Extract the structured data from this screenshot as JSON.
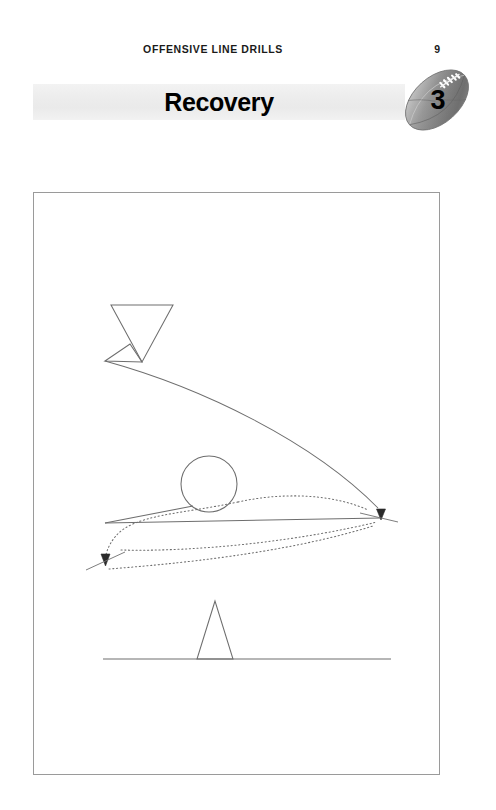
{
  "page": {
    "background_color": "#ffffff",
    "width": 496,
    "height": 810
  },
  "running_head": {
    "title": "OFFENSIVE LINE DRILLS",
    "folio": "9"
  },
  "title_band": {
    "chapter_title": "Recovery",
    "band_color": "#ededed"
  },
  "badge": {
    "icon": "football-icon",
    "chapter_number": "3",
    "ball_color": "#8c8c8c",
    "lace_color": "#ffffff"
  },
  "diagram": {
    "frame_color": "#9a9a9a",
    "line_color": "#6b6b6b",
    "elements": [
      {
        "name": "defender-triangle-down",
        "shape": "triangle-down",
        "cx": 141,
        "cy": 330,
        "width": 62,
        "height": 62
      },
      {
        "name": "blocking-wedge",
        "shape": "wedge",
        "points": "105,361 129,345 141,358"
      },
      {
        "name": "ball-circle",
        "shape": "circle",
        "cx": 209,
        "cy": 484,
        "r": 28
      },
      {
        "name": "offense-triangle-up",
        "shape": "triangle-up",
        "cx": 215,
        "cy": 631,
        "width": 36,
        "height": 58
      },
      {
        "name": "line-of-scrimmage",
        "shape": "line",
        "x1": 103,
        "y1": 659,
        "x2": 391,
        "y2": 659
      },
      {
        "name": "pursuit-path",
        "shape": "curve-solid-arrow",
        "from": "defender",
        "to": "right-arrowhead"
      },
      {
        "name": "recovery-path-solid",
        "shape": "line-solid-arrow",
        "from": "circle",
        "to": "right-arrowhead"
      },
      {
        "name": "recovery-path-dotted-left",
        "shape": "curve-dotted-arrow",
        "from": "circle",
        "to": "left-arrowhead"
      },
      {
        "name": "recovery-path-dotted-right",
        "shape": "curve-dotted",
        "from": "left",
        "to": "right"
      },
      {
        "name": "return-path-dotted",
        "shape": "line-dotted",
        "from": "right",
        "to": "lower-left"
      }
    ]
  }
}
